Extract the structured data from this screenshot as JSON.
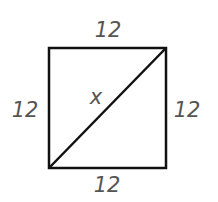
{
  "diagram": {
    "shape": "square",
    "labels": {
      "top": "12",
      "bottom": "12",
      "left": "12",
      "right": "12",
      "diagonal": "x"
    },
    "colors": {
      "stroke": "#111111",
      "label": "#555555"
    }
  }
}
